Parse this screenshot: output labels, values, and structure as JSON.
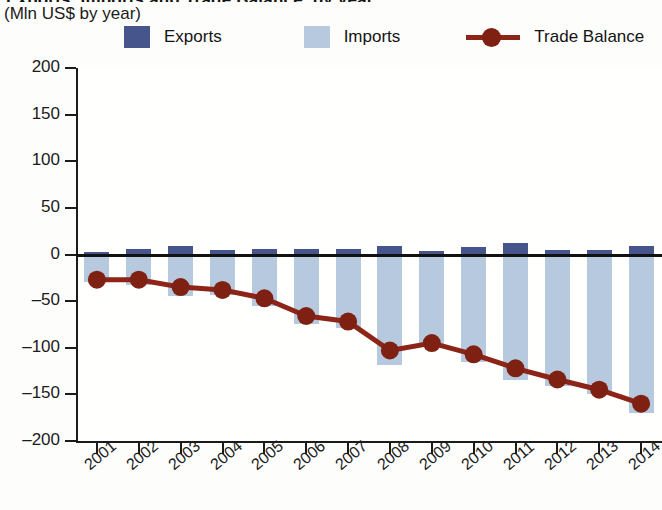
{
  "header": {
    "title_cropped": "Exports, Imports and Trade Balance, by year",
    "subtitle": "(Mln US$ by year)"
  },
  "legend": {
    "items": [
      {
        "label": "Exports",
        "color": "#46558c",
        "type": "swatch"
      },
      {
        "label": "Imports",
        "color": "#b7c9de",
        "type": "swatch"
      },
      {
        "label": "Trade Balance",
        "color": "#8c2418",
        "type": "line-marker"
      }
    ]
  },
  "axes": {
    "y_tick_labels": [
      "200",
      "150",
      "100",
      "50",
      "0",
      "–50",
      "–100",
      "–150",
      "–200"
    ],
    "x_tick_labels": [
      "2001",
      "2002",
      "2003",
      "2004",
      "2005",
      "2006",
      "2007",
      "2008",
      "2009",
      "2010",
      "2011",
      "2012",
      "2013",
      "2014"
    ]
  },
  "chart_data": {
    "type": "bar",
    "title": "Exports, Imports and Trade Balance, by year",
    "subtitle": "(Mln US$ by year)",
    "xlabel": "",
    "ylabel": "Mln US$ by year",
    "ylim": [
      -200,
      200
    ],
    "ytick_step": 50,
    "grid": false,
    "legend_position": "top",
    "categories": [
      "2001",
      "2002",
      "2003",
      "2004",
      "2005",
      "2006",
      "2007",
      "2008",
      "2009",
      "2010",
      "2011",
      "2012",
      "2013",
      "2014"
    ],
    "series": [
      {
        "name": "Exports",
        "type": "bar",
        "color": "#46558c",
        "values": [
          3,
          6,
          9,
          5,
          6,
          6,
          6,
          9,
          4,
          8,
          12,
          5,
          5,
          9
        ]
      },
      {
        "name": "Imports",
        "type": "bar",
        "color": "#b7c9de",
        "values": [
          -30,
          -33,
          -44,
          -43,
          -55,
          -74,
          -79,
          -118,
          -99,
          -115,
          -135,
          -141,
          -150,
          -170
        ]
      },
      {
        "name": "Trade Balance",
        "type": "line",
        "color": "#8c2418",
        "values": [
          -27,
          -27,
          -35,
          -38,
          -47,
          -66,
          -72,
          -103,
          -95,
          -107,
          -122,
          -134,
          -145,
          -160
        ]
      }
    ]
  }
}
